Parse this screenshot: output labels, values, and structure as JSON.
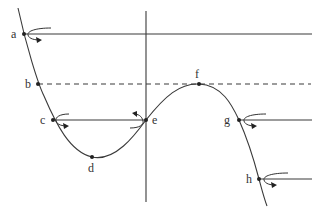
{
  "diagram": {
    "type": "cubic-curve-iteration-diagram",
    "colors": {
      "stroke": "#3a3a3a",
      "background": "#ffffff"
    },
    "points": [
      {
        "id": "a",
        "label": "a",
        "x": 24,
        "y": 34
      },
      {
        "id": "b",
        "label": "b",
        "x": 38,
        "y": 84
      },
      {
        "id": "c",
        "label": "c",
        "x": 53,
        "y": 120
      },
      {
        "id": "d",
        "label": "d",
        "x": 92,
        "y": 157
      },
      {
        "id": "e",
        "label": "e",
        "x": 146,
        "y": 120
      },
      {
        "id": "f",
        "label": "f",
        "x": 199,
        "y": 84
      },
      {
        "id": "g",
        "label": "g",
        "x": 239,
        "y": 120
      },
      {
        "id": "h",
        "label": "h",
        "x": 259,
        "y": 179
      }
    ],
    "lines": [
      {
        "id": "line-a",
        "from": "a",
        "to_x": 312,
        "style": "solid"
      },
      {
        "id": "line-b",
        "from": "b",
        "to_x": 311,
        "style": "dashed"
      },
      {
        "id": "line-c-e",
        "from": "c",
        "to": "e",
        "style": "solid"
      },
      {
        "id": "line-g",
        "from": "g",
        "to_x": 312,
        "style": "solid"
      },
      {
        "id": "line-h",
        "from": "h",
        "to_x": 312,
        "style": "solid"
      },
      {
        "id": "vertical-axis",
        "x": 146,
        "y1": 11,
        "y2": 202,
        "style": "solid"
      }
    ],
    "rotation_arrows": [
      "a",
      "c",
      "e",
      "g",
      "h"
    ]
  }
}
